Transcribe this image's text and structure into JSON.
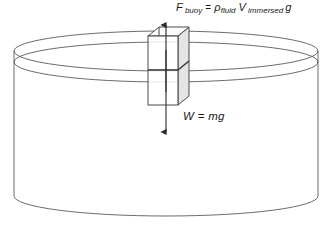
{
  "diagram": {
    "labels": {
      "buoyant_force": {
        "symbol": "F",
        "symbol_subscript": "buoy",
        "equals": "=",
        "density_symbol": "ρ",
        "density_subscript": "fluid",
        "volume_symbol": "V",
        "volume_subscript": "immersed",
        "gravity_symbol": "g",
        "full_text": "F buoy = ρ fluid V immersed g"
      },
      "weight": {
        "full_text": "W = mg"
      }
    },
    "arrows": [
      {
        "name": "buoyant-force-arrow",
        "direction": "up",
        "label": "F buoy = ρ fluid V immersed g"
      },
      {
        "name": "weight-arrow",
        "direction": "down",
        "label": "W = mg"
      }
    ],
    "objects": [
      {
        "name": "fluid-container",
        "shape": "cylinder"
      },
      {
        "name": "fluid-surface",
        "shape": "ellipse"
      },
      {
        "name": "immersed-block",
        "shape": "rectangular-prism"
      },
      {
        "name": "waterline-on-block",
        "shape": "line"
      }
    ],
    "colors": {
      "outline": "#4a4a4a",
      "block_outline": "#3a3a3a",
      "block_shade": "#e3e3e3",
      "arrow": "#2a2a2a",
      "text": "#1a1a1a",
      "background": "#ffffff"
    }
  }
}
